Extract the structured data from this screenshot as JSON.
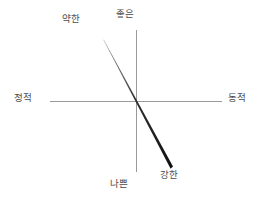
{
  "diagram": {
    "type": "two-axis-quadrant-chart",
    "background_color": "#ffffff",
    "axis_color": "#9a9a9a",
    "label_color": "#4a4a4a",
    "labels": {
      "top_left": "약한",
      "top_center": "좋은",
      "left": "정적",
      "right": "동적",
      "bottom_center": "나쁜",
      "bottom_right": "강한"
    },
    "axes": {
      "horizontal": {
        "from_label": "정적",
        "to_label": "동적"
      },
      "vertical": {
        "top_label": "좋은",
        "bottom_label": "나쁜"
      }
    },
    "trend_line": {
      "from_label": "약한",
      "to_label": "강한",
      "thin_end_color": "#9a9a9a",
      "thick_end_color": "#111111"
    }
  }
}
